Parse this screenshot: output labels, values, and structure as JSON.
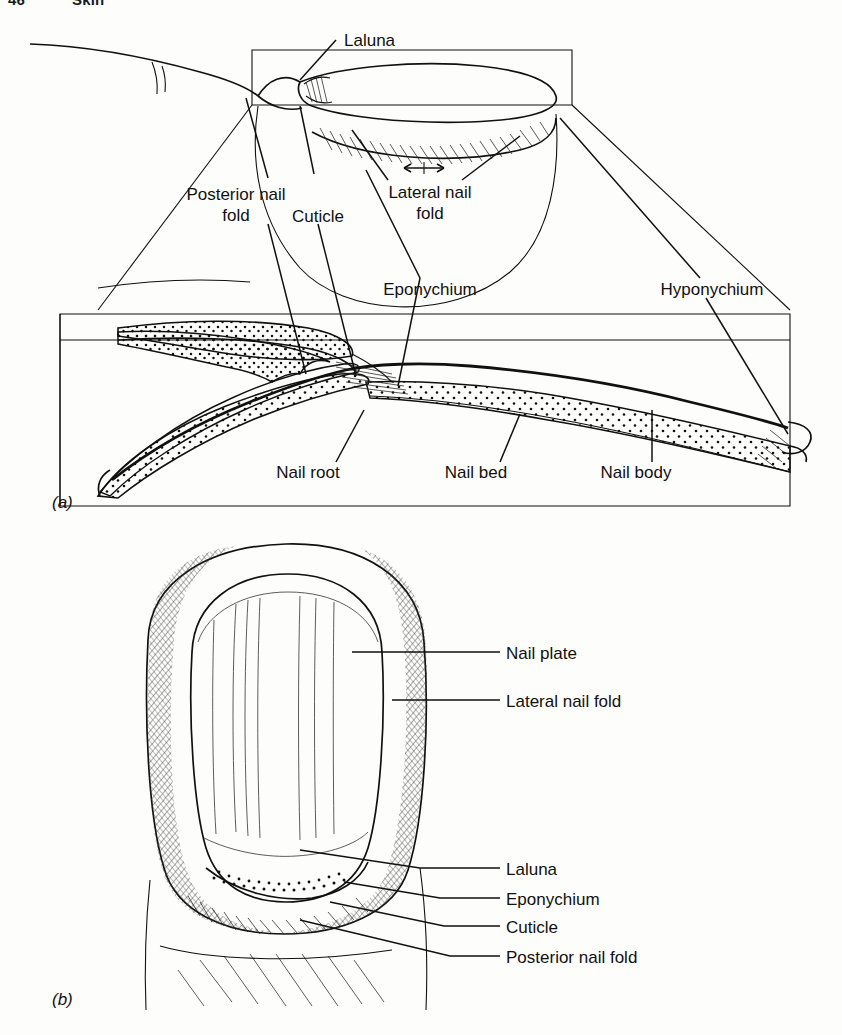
{
  "page_header": {
    "page_number": "46",
    "section_title": "Skin"
  },
  "figure": {
    "panel_a": {
      "marker": "(a)",
      "labels": {
        "laluna": "Laluna",
        "posterior_nail_fold": "Posterior nail\nfold",
        "posterior_nail_fold_line1": "Posterior nail",
        "posterior_nail_fold_line2": "fold",
        "cuticle": "Cuticle",
        "lateral_nail_fold_line1": "Lateral nail",
        "lateral_nail_fold_line2": "fold",
        "eponychium": "Eponychium",
        "hyponychium": "Hyponychium",
        "nail_root": "Nail root",
        "nail_bed": "Nail bed",
        "nail_body": "Nail body"
      }
    },
    "panel_b": {
      "marker": "(b)",
      "labels": {
        "nail_plate": "Nail plate",
        "lateral_nail_fold": "Lateral nail fold",
        "laluna": "Laluna",
        "eponychium": "Eponychium",
        "cuticle": "Cuticle",
        "posterior_nail_fold": "Posterior nail fold"
      }
    }
  },
  "colors": {
    "ink": "#111111",
    "paper": "#fdfdfb",
    "hatch": "#222222"
  }
}
